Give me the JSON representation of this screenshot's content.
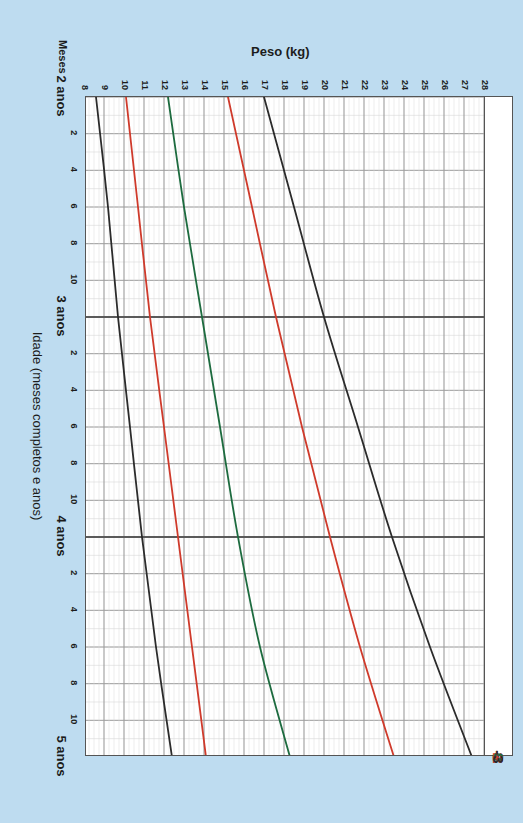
{
  "page": {
    "background_color": "#bedcf0",
    "plot_background_color": "#ffffff"
  },
  "axes": {
    "y_title": "Peso (kg)",
    "x_title": "Idade (meses completos e anos)",
    "months_label": "Meses",
    "y_ticks": [
      28,
      27,
      26,
      25,
      24,
      23,
      22,
      21,
      20,
      19,
      18,
      17,
      16,
      15,
      14,
      13,
      12,
      11,
      10,
      9,
      8
    ],
    "x_year_labels": [
      "2 anos",
      "3 anos",
      "4 anos",
      "5 anos"
    ],
    "x_month_ticks": [
      2,
      4,
      6,
      8,
      10
    ]
  },
  "curves": {
    "colors": {
      "black": "#2b2b2b",
      "red": "#cf3a2b",
      "green": "#1d6b3f",
      "major_grid": "#8c8c8c",
      "minor_grid": "#d8d8d8",
      "year_line": "#5a5a5a"
    },
    "labels": [
      {
        "text": "3",
        "color": "#2b2b2b"
      },
      {
        "text": "2",
        "color": "#cf3a2b"
      },
      {
        "text": "0",
        "color": "#1d6b3f"
      },
      {
        "text": "-2",
        "color": "#cf3a2b"
      },
      {
        "text": "-3",
        "color": "#2b2b2b"
      }
    ]
  },
  "chart_data": {
    "type": "line",
    "title": "",
    "xlabel": "Idade (meses completos e anos)",
    "ylabel": "Peso (kg)",
    "xlim": [
      24,
      60
    ],
    "ylim": [
      8,
      28
    ],
    "grid": true,
    "legend": "inline-labels-at-right-end-of-each-curve",
    "x_unit": "months",
    "x": [
      24,
      30,
      36,
      42,
      48,
      54,
      60
    ],
    "x_tick_labels": [
      "2 anos",
      "6",
      "3 anos",
      "6",
      "4 anos",
      "6",
      "5 anos"
    ],
    "series": [
      {
        "name": "3",
        "zscore": 3,
        "color": "#2b2b2b",
        "values": [
          17.0,
          18.5,
          20.0,
          21.7,
          23.4,
          25.3,
          27.4
        ]
      },
      {
        "name": "2",
        "zscore": 2,
        "color": "#cf3a2b",
        "values": [
          15.2,
          16.4,
          17.6,
          18.9,
          20.3,
          21.8,
          23.5
        ]
      },
      {
        "name": "0",
        "zscore": 0,
        "color": "#1d6b3f",
        "values": [
          12.2,
          13.0,
          13.9,
          14.8,
          15.7,
          16.8,
          18.3
        ]
      },
      {
        "name": "-2",
        "zscore": -2,
        "color": "#cf3a2b",
        "values": [
          10.1,
          10.7,
          11.3,
          12.0,
          12.7,
          13.4,
          14.1
        ]
      },
      {
        "name": "-3",
        "zscore": -3,
        "color": "#2b2b2b",
        "values": [
          8.6,
          9.2,
          9.7,
          10.3,
          10.9,
          11.6,
          12.4
        ]
      }
    ]
  }
}
